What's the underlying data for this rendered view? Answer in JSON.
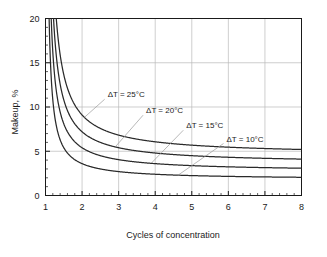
{
  "chart_data": {
    "type": "line",
    "title": "",
    "xlabel": "Cycles of concentration",
    "ylabel": "Makeup, %",
    "xlim": [
      1,
      8
    ],
    "ylim": [
      0,
      20
    ],
    "xticks": [
      "1",
      "2",
      "3",
      "4",
      "5",
      "6",
      "7",
      "8"
    ],
    "yticks": [
      "0",
      "5",
      "10",
      "15",
      "20"
    ],
    "x_minor_per_interval": 5,
    "y_minor_per_interval": 5,
    "grid": "both",
    "legend": "inline-annotations",
    "x": [
      1.15,
      1.2,
      1.3,
      1.4,
      1.5,
      1.6,
      1.8,
      2.0,
      2.25,
      2.5,
      2.75,
      3.0,
      3.5,
      4.0,
      4.5,
      5.0,
      5.5,
      6.0,
      6.5,
      7.0,
      7.5,
      8.0
    ],
    "series": [
      {
        "name": "ΔT = 25°C",
        "label": "ΔT = 25°C",
        "delta_t": 25,
        "asymptote": 4.55,
        "values": [
          34.9,
          27.3,
          19.7,
          15.9,
          13.65,
          12.13,
          10.24,
          9.1,
          8.19,
          7.58,
          7.15,
          6.83,
          6.37,
          6.07,
          5.85,
          5.69,
          5.56,
          5.46,
          5.38,
          5.31,
          5.25,
          5.2
        ],
        "label_x": 2.7,
        "label_y": 11.1,
        "leader_to_x": 2.07,
        "leader_to_y": 8.85
      },
      {
        "name": "ΔT = 20°C",
        "label": "ΔT = 20°C",
        "delta_t": 20,
        "asymptote": 3.6,
        "values": [
          27.6,
          21.6,
          15.6,
          12.6,
          10.8,
          9.6,
          8.1,
          7.2,
          6.48,
          6.0,
          5.66,
          5.4,
          5.04,
          4.8,
          4.63,
          4.5,
          4.4,
          4.32,
          4.25,
          4.2,
          4.15,
          4.11
        ],
        "label_x": 3.75,
        "label_y": 9.3,
        "leader_to_x": 2.92,
        "leader_to_y": 5.55
      },
      {
        "name": "ΔT = 15°C",
        "label": "ΔT = 15°C",
        "delta_t": 15,
        "asymptote": 2.7,
        "values": [
          20.7,
          16.2,
          11.7,
          9.45,
          8.1,
          7.2,
          6.08,
          5.4,
          4.86,
          4.5,
          4.24,
          4.05,
          3.78,
          3.6,
          3.47,
          3.38,
          3.3,
          3.24,
          3.19,
          3.15,
          3.11,
          3.09
        ],
        "label_x": 4.85,
        "label_y": 7.6,
        "leader_to_x": 3.9,
        "leader_to_y": 3.68
      },
      {
        "name": "ΔT = 10°C",
        "label": "ΔT = 10°C",
        "delta_t": 10,
        "asymptote": 1.8,
        "values": [
          13.8,
          10.8,
          7.8,
          6.3,
          5.4,
          4.8,
          4.05,
          3.6,
          3.24,
          3.0,
          2.83,
          2.7,
          2.52,
          2.4,
          2.31,
          2.25,
          2.2,
          2.16,
          2.12,
          2.1,
          2.07,
          2.06
        ],
        "label_x": 5.95,
        "label_y": 6.1,
        "leader_to_x": 4.62,
        "leader_to_y": 2.28
      }
    ]
  }
}
